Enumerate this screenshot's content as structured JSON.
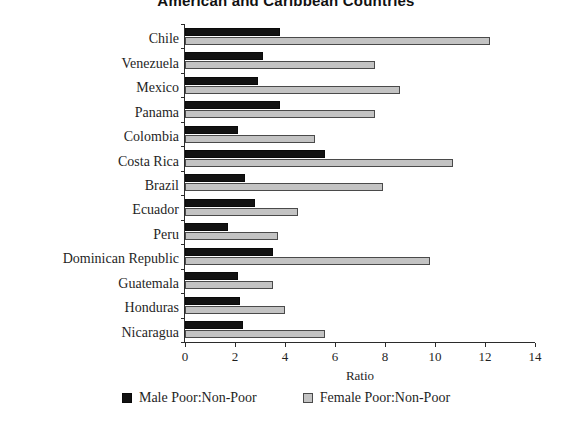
{
  "chart_data": {
    "type": "bar",
    "orientation": "horizontal",
    "title": "American and Caribbean Countries",
    "xlabel": "Ratio",
    "ylabel": "",
    "xlim": [
      0,
      14
    ],
    "xticks": [
      0,
      2,
      4,
      6,
      8,
      10,
      12,
      14
    ],
    "xtick_labels": [
      "0",
      "2",
      "4",
      "6",
      "8",
      "10",
      "12",
      "14"
    ],
    "grid": false,
    "legend_position": "bottom",
    "categories": [
      "Chile",
      "Venezuela",
      "Mexico",
      "Panama",
      "Colombia",
      "Costa Rica",
      "Brazil",
      "Ecuador",
      "Peru",
      "Dominican Republic",
      "Guatemala",
      "Honduras",
      "Nicaragua"
    ],
    "series": [
      {
        "name": "Male Poor:Non-Poor",
        "color": "#121212",
        "values": [
          3.8,
          3.1,
          2.9,
          3.8,
          2.1,
          5.6,
          2.4,
          2.8,
          1.7,
          3.5,
          2.1,
          2.2,
          2.3
        ]
      },
      {
        "name": "Female Poor:Non-Poor",
        "color": "#c3c3c3",
        "values": [
          12.2,
          7.6,
          8.6,
          7.6,
          5.2,
          10.7,
          7.9,
          4.5,
          3.7,
          9.8,
          3.5,
          4.0,
          5.6
        ]
      }
    ]
  },
  "legend": {
    "items": [
      {
        "label": "Male Poor:Non-Poor",
        "swatch": "male-swatch-icon"
      },
      {
        "label": "Female Poor:Non-Poor",
        "swatch": "female-swatch-icon"
      }
    ]
  }
}
